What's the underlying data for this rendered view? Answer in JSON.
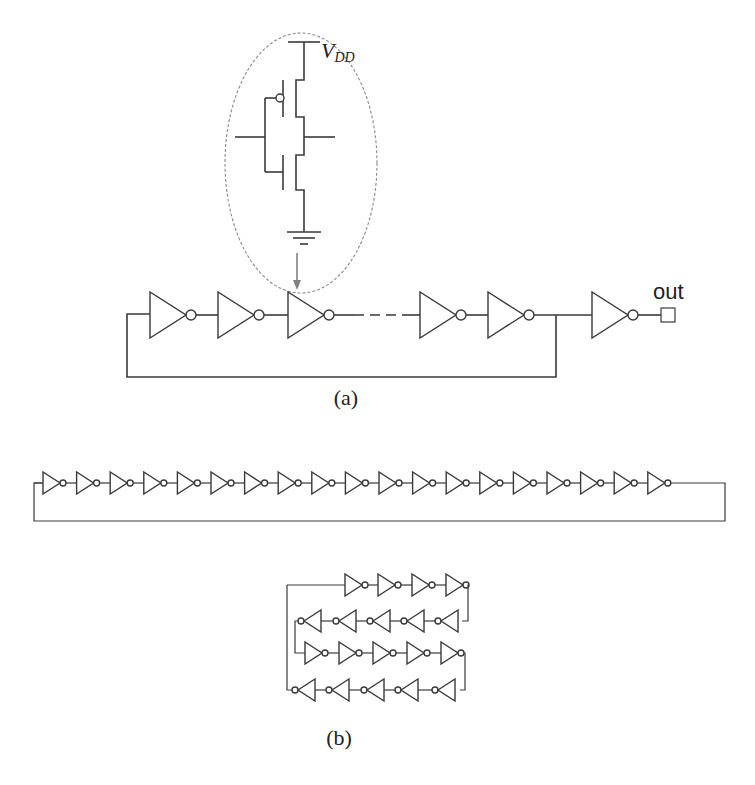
{
  "figure": {
    "panel_a": {
      "caption": "(a)",
      "supply_label": "V",
      "supply_subscript": "DD",
      "output_label": "out",
      "description": "Ring oscillator of odd inverter chain with output buffer; inset shows CMOS inverter (PMOS/NMOS) between VDD and ground",
      "visible_inverters_in_ring": 5,
      "buffer_inverters": 1,
      "inset": "cmos-inverter-transistor-schematic"
    },
    "panel_b": {
      "caption": "(b)",
      "linear_layout": {
        "description": "Linear ring of inverters with feedback wire",
        "inverter_count": 19
      },
      "serpentine_layout": {
        "description": "Folded (serpentine) ring of inverters",
        "rows": [
          {
            "direction": "right",
            "count": 4
          },
          {
            "direction": "left",
            "count": 5
          },
          {
            "direction": "right",
            "count": 5
          },
          {
            "direction": "left",
            "count": 5
          }
        ],
        "inverter_count": 19
      }
    },
    "colors": {
      "line": "#3a3a3a",
      "inset_outline": "#8a8a8a",
      "arrow": "#808080",
      "background": "#ffffff"
    }
  }
}
